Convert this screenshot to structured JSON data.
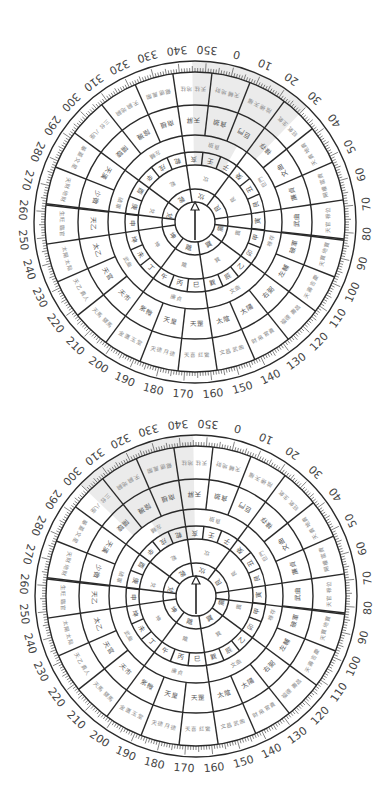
{
  "colors": {
    "line": "#2a2a2a",
    "shade": "#ebebeb",
    "text_light": "#8a8a8a",
    "text_dark": "#555555",
    "background": "#ffffff"
  },
  "degree_labels": [
    0,
    10,
    20,
    30,
    40,
    50,
    60,
    70,
    80,
    90,
    100,
    110,
    120,
    130,
    140,
    150,
    160,
    170,
    180,
    190,
    200,
    210,
    220,
    230,
    240,
    250,
    260,
    270,
    280,
    290,
    300,
    310,
    320,
    330,
    340,
    350
  ],
  "rings": {
    "radii": [
      20,
      33,
      57,
      70,
      87,
      117,
      150,
      161
    ],
    "trigrams": [
      "坎",
      "艮",
      "震",
      "巽",
      "離",
      "坤",
      "兌",
      "乾"
    ],
    "mountains": [
      "壬",
      "子",
      "癸",
      "丑",
      "艮",
      "寅",
      "甲",
      "卯",
      "乙",
      "辰",
      "巽",
      "巳",
      "丙",
      "午",
      "丁",
      "未",
      "坤",
      "申",
      "庚",
      "酉",
      "辛",
      "戌",
      "乾",
      "亥"
    ],
    "stars": [
      "貪狼",
      "巨門",
      "祿存",
      "文曲",
      "廉貞",
      "武曲",
      "破軍",
      "左輔",
      "右弼",
      "太陽",
      "太陰",
      "天罡",
      "天皇",
      "紫微",
      "天市",
      "天官",
      "太乙",
      "天乙",
      "少微",
      "天漢",
      "陽璇",
      "陰璣",
      "南極",
      "天屏"
    ],
    "outer": [
      "天輔 地財",
      "陰德 天福",
      "旺氣 生氣",
      "天貴 地貴",
      "陽權 富貴",
      "天官 祿位",
      "天寶 地寶",
      "天壽 吉慶",
      "福德 壽昌",
      "財帛 官貴",
      "文昌 武曲",
      "天喜 紅鸞",
      "天德 月德",
      "金匱 玉堂",
      "天馬 驛馬",
      "天乙 貴人",
      "太陽 太陰",
      "生旺 臨官",
      "天財 地財",
      "華蓋 文星",
      "三台 八座",
      "天嗣 地嗣",
      "龍德 鳳閣",
      "天柱 地柱"
    ]
  },
  "dials": [
    {
      "name": "top-dial",
      "center": [
        195,
        222
      ],
      "rotation": 14,
      "needle": "north-needle",
      "shaded": [
        {
          "ring_from": 4,
          "ring_to": 7,
          "start": 345,
          "end": 30
        },
        {
          "ring_from": 2,
          "ring_to": 4,
          "start": 345,
          "end": 15
        }
      ],
      "split_angle": 83
    },
    {
      "name": "bottom-dial",
      "center": [
        196,
        596
      ],
      "rotation": 14,
      "needle": "north-needle",
      "shaded": [
        {
          "ring_from": 4,
          "ring_to": 7,
          "start": 300,
          "end": 345
        },
        {
          "ring_from": 2,
          "ring_to": 4,
          "start": 315,
          "end": 345
        }
      ],
      "split_angle": 83
    }
  ]
}
